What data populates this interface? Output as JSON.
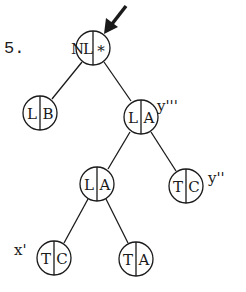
{
  "figure": {
    "number_label": "5.",
    "ink_color": "#1a1a1a",
    "background": "#ffffff"
  },
  "nodes": [
    {
      "id": "root",
      "left": "NL",
      "right": "*",
      "cx": 93,
      "cy": 48,
      "r": 17,
      "annotation": ""
    },
    {
      "id": "lb",
      "left": "L",
      "right": "B",
      "cx": 40,
      "cy": 113,
      "r": 17,
      "annotation": ""
    },
    {
      "id": "la-upper",
      "left": "L",
      "right": "A",
      "cx": 141,
      "cy": 117,
      "r": 17,
      "annotation": "y'''"
    },
    {
      "id": "la-lower",
      "left": "L",
      "right": "A",
      "cx": 97,
      "cy": 184,
      "r": 17,
      "annotation": ""
    },
    {
      "id": "tc-right",
      "left": "T",
      "right": "C",
      "cx": 186,
      "cy": 186,
      "r": 17,
      "annotation": "y''"
    },
    {
      "id": "tc-bottom",
      "left": "T",
      "right": "C",
      "cx": 54,
      "cy": 258,
      "r": 17,
      "annotation": "x'"
    },
    {
      "id": "ta-bottom",
      "left": "T",
      "right": "A",
      "cx": 136,
      "cy": 259,
      "r": 17,
      "annotation": ""
    }
  ],
  "edges": [
    {
      "from": "root",
      "to": "lb"
    },
    {
      "from": "root",
      "to": "la-upper"
    },
    {
      "from": "la-upper",
      "to": "la-lower"
    },
    {
      "from": "la-upper",
      "to": "tc-right"
    },
    {
      "from": "la-lower",
      "to": "tc-bottom"
    },
    {
      "from": "la-lower",
      "to": "ta-bottom"
    }
  ],
  "pointer": {
    "target": "root",
    "description": "arrow pointing at root node"
  },
  "annotations": {
    "la_upper": "y'''",
    "tc_right": "y''",
    "tc_bottom": "x'"
  }
}
